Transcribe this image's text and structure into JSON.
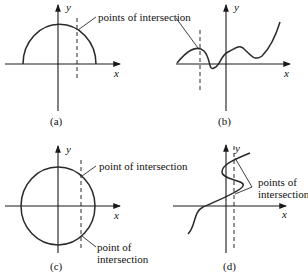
{
  "panels": {
    "a": {
      "caption": "(a)",
      "x_label": "x",
      "y_label": "y",
      "annotation": "points of intersection"
    },
    "b": {
      "caption": "(b)",
      "x_label": "x",
      "y_label": "y"
    },
    "c": {
      "caption": "(c)",
      "x_label": "x",
      "y_label": "y",
      "annotation_top": "point of intersection",
      "annotation_bottom_line1": "point of",
      "annotation_bottom_line2": "intersection"
    },
    "d": {
      "caption": "(d)",
      "x_label": "x",
      "y_label": "y",
      "annotation_line1": "points of",
      "annotation_line2": "intersection"
    }
  }
}
